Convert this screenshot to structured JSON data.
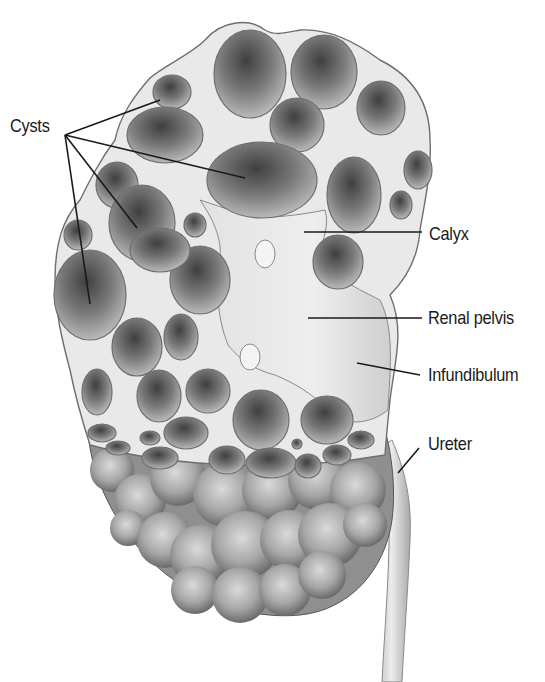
{
  "figure": {
    "clipped_top_text": "",
    "labels": {
      "cysts": "Cysts",
      "calyx": "Calyx",
      "renal_pelvis": "Renal pelvis",
      "infundibulum": "Infundibulum",
      "ureter": "Ureter"
    },
    "colors": {
      "background": "#ffffff",
      "tissue": "#e9e9e9",
      "outline": "#6e6e6e",
      "cyst_dark": "#4d4d4d",
      "cyst_light": "#a9a9a9",
      "leader_line": "#1a1a1a",
      "text": "#1a1a1a"
    }
  }
}
